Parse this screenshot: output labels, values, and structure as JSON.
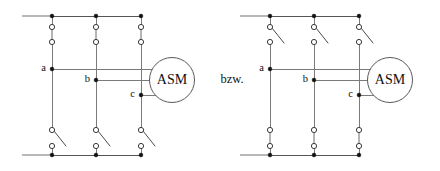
{
  "figure": {
    "name": "three-phase-motor-switching-diagram",
    "connector_label": "bzw.",
    "machine_label": "ASM"
  },
  "circuits": [
    {
      "id": "left",
      "machine_label": "ASM",
      "upper_switch_state": "closed",
      "lower_switch_state": "open",
      "terminals": [
        {
          "label": "a",
          "phase": 1
        },
        {
          "label": "b",
          "phase": 2
        },
        {
          "label": "c",
          "phase": 3
        }
      ]
    },
    {
      "id": "right",
      "machine_label": "ASM",
      "upper_switch_state": "open",
      "lower_switch_state": "closed",
      "terminals": [
        {
          "label": "a",
          "phase": 1
        },
        {
          "label": "b",
          "phase": 2
        },
        {
          "label": "c",
          "phase": 3
        }
      ]
    }
  ],
  "colors": {
    "wire": "#7a7a7a",
    "rail": "#9a9a9a",
    "node": "#111111",
    "contact_stroke": "#3a3a3a",
    "machine_stroke": "#5a5a5a",
    "text": "#111111",
    "background": "#ffffff"
  }
}
